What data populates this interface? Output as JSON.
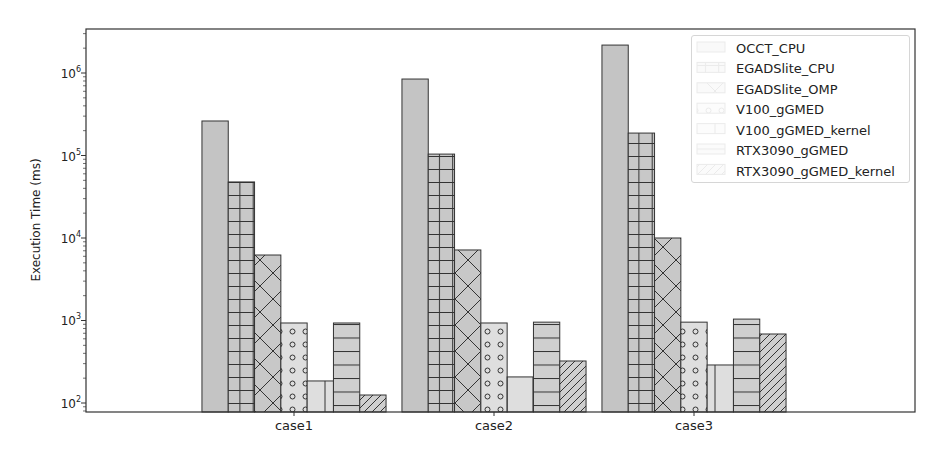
{
  "chart_data": {
    "type": "bar",
    "title": "",
    "xlabel": "",
    "ylabel": "Execution Time (ms)",
    "yscale": "log",
    "ylim": [
      75,
      2600000
    ],
    "yticks": [
      "10^2",
      "10^3",
      "10^4",
      "10^5",
      "10^6"
    ],
    "grid": false,
    "legend_position": "upper right",
    "categories": [
      "case1",
      "case2",
      "case3"
    ],
    "series": [
      {
        "name": "OCCT_CPU",
        "hatch": "none",
        "fill": "#c4c4c4",
        "values": [
          262000,
          845000,
          2180000
        ]
      },
      {
        "name": "EGADSlite_CPU",
        "hatch": "grid",
        "fill": "#c8c8c8",
        "values": [
          47800,
          104000,
          187000
        ]
      },
      {
        "name": "EGADSlite_OMP",
        "hatch": "cross-diagonal",
        "fill": "#c8c8c8",
        "values": [
          6220,
          7160,
          10000
        ]
      },
      {
        "name": "V100_gGMED",
        "hatch": "circles",
        "fill": "#dedede",
        "values": [
          933,
          933,
          955
        ]
      },
      {
        "name": "V100_gGMED_kernel",
        "hatch": "vertical",
        "fill": "#dedede",
        "values": [
          185,
          207,
          289
        ]
      },
      {
        "name": "RTX3090_gGMED",
        "hatch": "horizontal",
        "fill": "#cfcfcf",
        "values": [
          933,
          955,
          1040
        ]
      },
      {
        "name": "RTX3090_gGMED_kernel",
        "hatch": "diagonal",
        "fill": "#cfcfcf",
        "values": [
          125,
          323,
          686
        ]
      }
    ]
  },
  "axes": {
    "ylabel": "Execution Time (ms)",
    "yticks": [
      {
        "base": "10",
        "exp": "2"
      },
      {
        "base": "10",
        "exp": "3"
      },
      {
        "base": "10",
        "exp": "4"
      },
      {
        "base": "10",
        "exp": "5"
      },
      {
        "base": "10",
        "exp": "6"
      }
    ],
    "xticks": [
      "case1",
      "case2",
      "case3"
    ]
  },
  "legend": {
    "items": [
      "OCCT_CPU",
      "EGADSlite_CPU",
      "EGADSlite_OMP",
      "V100_gGMED",
      "V100_gGMED_kernel",
      "RTX3090_gGMED",
      "RTX3090_gGMED_kernel"
    ]
  }
}
